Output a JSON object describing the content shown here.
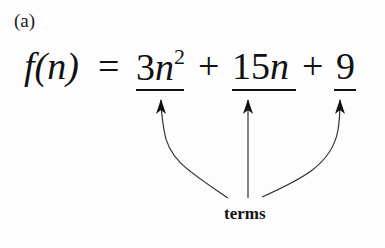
{
  "figure": {
    "panel_label": "(a)",
    "lhs": "f(n)",
    "equals": "=",
    "terms": [
      {
        "coef": "3",
        "var": "n",
        "exp": "2"
      },
      {
        "coef": "15",
        "var": "n",
        "exp": ""
      },
      {
        "coef": "9",
        "var": "",
        "exp": ""
      }
    ],
    "plus": "+",
    "annotation": "terms"
  }
}
